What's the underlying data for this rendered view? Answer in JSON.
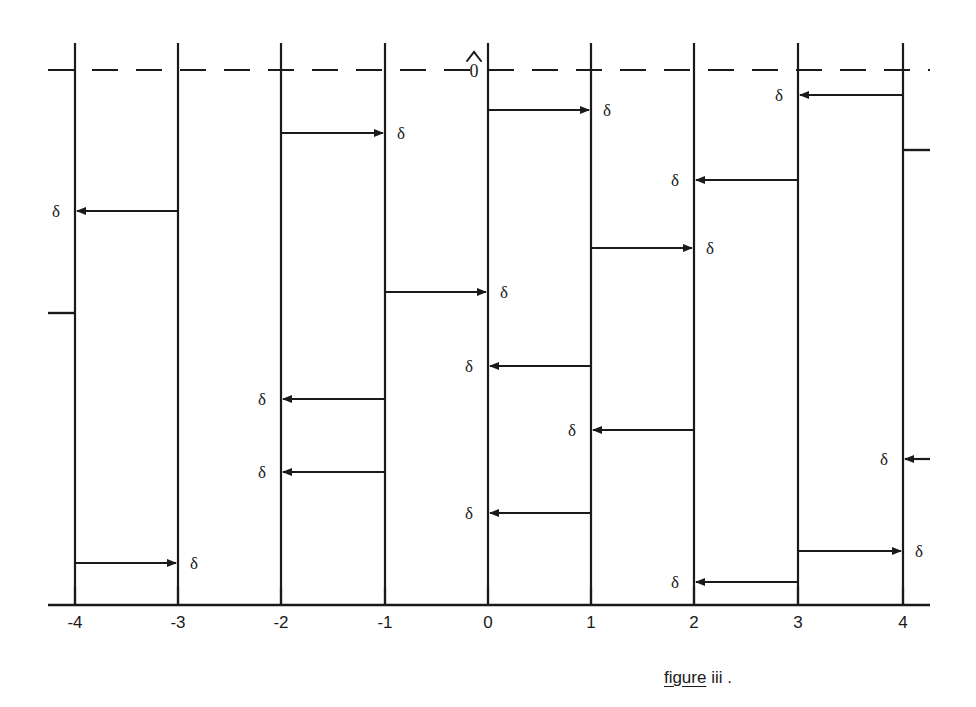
{
  "figure": {
    "caption_underlined": "figure",
    "caption_rest": " iii .",
    "origin_label": "0̂",
    "origin_label_base": "0",
    "delta_symbol": "δ",
    "ink_color": "#1a1a1a"
  },
  "axis": {
    "label": "",
    "y_pixel": 605,
    "x_left_pixel": 48,
    "x_right_pixel": 930,
    "unit_pixels": 103.5,
    "ticks": [
      {
        "value": -4,
        "label": "-4",
        "x": 75
      },
      {
        "value": -3,
        "label": "-3",
        "x": 178
      },
      {
        "value": -2,
        "label": "-2",
        "x": 281
      },
      {
        "value": -1,
        "label": "-1",
        "x": 385
      },
      {
        "value": 0,
        "label": "0",
        "x": 488
      },
      {
        "value": 1,
        "label": "1",
        "x": 591
      },
      {
        "value": 2,
        "label": "2",
        "x": 694
      },
      {
        "value": 3,
        "label": "3",
        "x": 798
      },
      {
        "value": 4,
        "label": "4",
        "x": 903
      }
    ]
  },
  "dashed_line": {
    "y": 70,
    "x_start": 48,
    "x_end": 930,
    "dash_pattern": "26 18"
  },
  "vertical_lines": [
    {
      "value": -4,
      "x": 75,
      "y_top": 43,
      "y_bottom": 605
    },
    {
      "value": -3,
      "x": 178,
      "y_top": 43,
      "y_bottom": 605
    },
    {
      "value": -2,
      "x": 281,
      "y_top": 43,
      "y_bottom": 605
    },
    {
      "value": -1,
      "x": 385,
      "y_top": 43,
      "y_bottom": 605
    },
    {
      "value": 0,
      "x": 488,
      "y_top": 43,
      "y_bottom": 605
    },
    {
      "value": 1,
      "x": 591,
      "y_top": 43,
      "y_bottom": 605
    },
    {
      "value": 2,
      "x": 694,
      "y_top": 43,
      "y_bottom": 605
    },
    {
      "value": 3,
      "x": 798,
      "y_top": 43,
      "y_bottom": 605
    },
    {
      "value": 4,
      "x": 903,
      "y_top": 43,
      "y_bottom": 605
    }
  ],
  "stub_ticks": [
    {
      "id": "left-stub",
      "x_from": 48,
      "x_to": 75,
      "y": 313
    },
    {
      "id": "right-stub",
      "x_from": 903,
      "x_to": 930,
      "y": 150
    }
  ],
  "arrows": [
    {
      "id": "a1",
      "from_value": -3,
      "to_value": -4,
      "from_x": 178,
      "to_x": 75,
      "y": 211,
      "direction": "left",
      "label": "δ",
      "label_x": 60,
      "label_side": "left"
    },
    {
      "id": "a2",
      "from_value": -4,
      "to_value": -3,
      "from_x": 75,
      "to_x": 178,
      "y": 563,
      "direction": "right",
      "label": "δ",
      "label_x": 190,
      "label_side": "right"
    },
    {
      "id": "a3",
      "from_value": -2,
      "to_value": -1,
      "from_x": 281,
      "to_x": 385,
      "y": 133,
      "direction": "right",
      "label": "δ",
      "label_x": 397,
      "label_side": "right"
    },
    {
      "id": "a4",
      "from_value": -1,
      "to_value": -2,
      "from_x": 385,
      "to_x": 281,
      "y": 399,
      "direction": "left",
      "label": "δ",
      "label_x": 266,
      "label_side": "left"
    },
    {
      "id": "a5",
      "from_value": -1,
      "to_value": -2,
      "from_x": 385,
      "to_x": 281,
      "y": 472,
      "direction": "left",
      "label": "δ",
      "label_x": 266,
      "label_side": "left"
    },
    {
      "id": "a6",
      "from_value": -1,
      "to_value": 0,
      "from_x": 385,
      "to_x": 488,
      "y": 292,
      "direction": "right",
      "label": "δ",
      "label_x": 500,
      "label_side": "right"
    },
    {
      "id": "a7",
      "from_value": 0,
      "to_value": 1,
      "from_x": 488,
      "to_x": 591,
      "y": 110,
      "direction": "right",
      "label": "δ",
      "label_x": 603,
      "label_side": "right"
    },
    {
      "id": "a8",
      "from_value": 1,
      "to_value": 0,
      "from_x": 591,
      "to_x": 488,
      "y": 366,
      "direction": "left",
      "label": "δ",
      "label_x": 473,
      "label_side": "left"
    },
    {
      "id": "a9",
      "from_value": 1,
      "to_value": 0,
      "from_x": 591,
      "to_x": 488,
      "y": 513,
      "direction": "left",
      "label": "δ",
      "label_x": 473,
      "label_side": "left"
    },
    {
      "id": "a10",
      "from_value": 1,
      "to_value": 2,
      "from_x": 591,
      "to_x": 694,
      "y": 248,
      "direction": "right",
      "label": "δ",
      "label_x": 706,
      "label_side": "right"
    },
    {
      "id": "a11",
      "from_value": 2,
      "to_value": 1,
      "from_x": 694,
      "to_x": 591,
      "y": 430,
      "direction": "left",
      "label": "δ",
      "label_x": 576,
      "label_side": "left"
    },
    {
      "id": "a12",
      "from_value": 3,
      "to_value": 2,
      "from_x": 798,
      "to_x": 694,
      "y": 180,
      "direction": "left",
      "label": "δ",
      "label_x": 679,
      "label_side": "left"
    },
    {
      "id": "a13",
      "from_value": 3,
      "to_value": 2,
      "from_x": 798,
      "to_x": 694,
      "y": 582,
      "direction": "left",
      "label": "δ",
      "label_x": 679,
      "label_side": "left"
    },
    {
      "id": "a14",
      "from_value": 4,
      "to_value": 3,
      "from_x": 903,
      "to_x": 798,
      "y": 95,
      "direction": "left",
      "label": "δ",
      "label_x": 783,
      "label_side": "left"
    },
    {
      "id": "a15",
      "from_value": 3,
      "to_value": 4,
      "from_x": 798,
      "to_x": 903,
      "y": 551,
      "direction": "right",
      "label": "δ",
      "label_x": 915,
      "label_side": "right"
    },
    {
      "id": "a16",
      "from_value": null,
      "to_value": 4,
      "from_x": 930,
      "to_x": 903,
      "y": 459,
      "direction": "left",
      "label": "δ",
      "label_x": 888,
      "label_side": "left"
    }
  ],
  "caption_position": {
    "left": 645,
    "top": 648
  }
}
